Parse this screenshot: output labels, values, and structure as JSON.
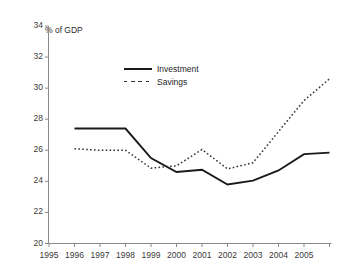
{
  "chart_data": {
    "type": "line",
    "title": "",
    "subtitle": "",
    "annotation": "% of GDP",
    "xlabel": "",
    "ylabel": "",
    "ylim": [
      20,
      34
    ],
    "ytick_step": 2,
    "yticks": [
      "20",
      "22",
      "24",
      "26",
      "28",
      "30",
      "32",
      "34"
    ],
    "xticks": [
      "1995",
      "1996",
      "1997",
      "1998",
      "1999",
      "2000",
      "2001",
      "2002",
      "2003",
      "2004",
      "2005"
    ],
    "grid": false,
    "legend_position": "upper-center",
    "x": [
      1996,
      1997,
      1998,
      1999,
      2000,
      2001,
      2002,
      2003,
      2004,
      2005,
      2006
    ],
    "series": [
      {
        "name": "Investment",
        "style": "solid",
        "color": "#1a1a1a",
        "values": [
          27.4,
          27.4,
          27.4,
          25.5,
          24.6,
          24.75,
          23.8,
          24.05,
          24.7,
          25.75,
          25.85
        ]
      },
      {
        "name": "Savings",
        "style": "dotted",
        "color": "#333333",
        "values": [
          26.1,
          26.0,
          26.0,
          24.85,
          25.0,
          26.05,
          24.8,
          25.2,
          27.2,
          29.2,
          30.6
        ]
      }
    ]
  },
  "legend": {
    "investment_label": "Investment",
    "savings_label": "Savings"
  },
  "axes": {
    "y_note": "% of GDP"
  }
}
